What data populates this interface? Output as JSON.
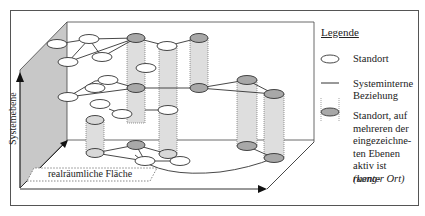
{
  "legend": {
    "title": "Legende",
    "items": [
      {
        "symbol": "white-ellipse",
        "label": "Standort"
      },
      {
        "symbol": "line",
        "label_line1": "Systeminterne",
        "label_line2": "Beziehung"
      },
      {
        "symbol": "grey-ellipse-dotted-cylinder",
        "label_line1": "Standort, auf",
        "label_line2": "mehreren der",
        "label_line3": "eingezeichne-",
        "label_line4": "ten Ebenen",
        "label_line5a": "aktiv ist ",
        "label_line5b": "(kong-",
        "label_line6": "ruenter Ort)"
      }
    ]
  },
  "axes": {
    "vertical_label": "Systemebene",
    "horizontal_label": "realräumliche Fläche"
  },
  "colors": {
    "plane_grey": "#c8c8c8",
    "cylinder_fill": "#dedede",
    "node_grey": "#a8a8a8",
    "line": "#333333"
  }
}
